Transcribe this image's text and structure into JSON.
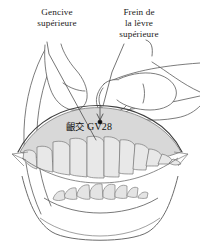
{
  "figure": {
    "background_color": "#ffffff",
    "stroke_color": "#555555",
    "gum_fill_color": "#d8d8d8",
    "tooth_fill_color": "#e6e6e6",
    "marker_color": "#111111"
  },
  "labels": {
    "gencive": {
      "name": "Gencive supérieure",
      "lines": [
        "Gencive",
        "supérieure"
      ]
    },
    "frein": {
      "name": "Frein de la lèvre supérieure",
      "lines": [
        "Frein de",
        "la lèvre",
        "supérieure"
      ]
    }
  },
  "acupoint": {
    "chinese_name": "齦交",
    "code": "GV28"
  },
  "anatomy": {
    "upper_teeth_count": 11,
    "lower_teeth_count": 8,
    "fingers_visible": 2,
    "thumb_visible": 1
  }
}
